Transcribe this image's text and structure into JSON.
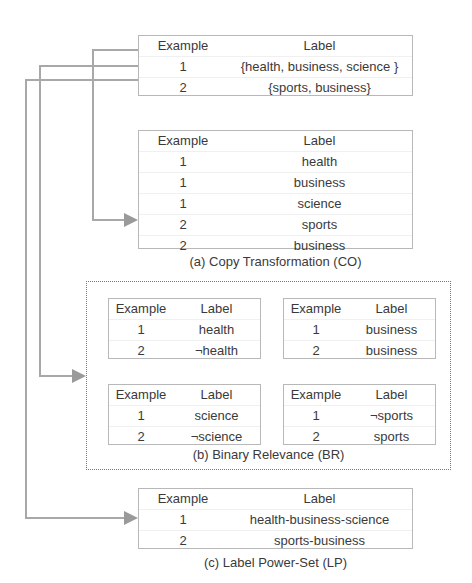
{
  "colors": {
    "connector": "#a8a8a8",
    "arrowhead": "#9a9a9a",
    "table_border": "#b8b8b8",
    "text": "#3a3a3a"
  },
  "original": {
    "headers": [
      "Example",
      "Label"
    ],
    "rows": [
      [
        "1",
        "{health, business, science }"
      ],
      [
        "2",
        "{sports, business}"
      ]
    ]
  },
  "copy_transformation": {
    "caption": "(a) Copy Transformation (CO)",
    "headers": [
      "Example",
      "Label"
    ],
    "rows": [
      [
        "1",
        "health"
      ],
      [
        "1",
        "business"
      ],
      [
        "1",
        "science"
      ],
      [
        "2",
        "sports"
      ],
      [
        "2",
        "business"
      ]
    ]
  },
  "binary_relevance": {
    "caption": "(b) Binary Relevance (BR)",
    "tables": [
      {
        "headers": [
          "Example",
          "Label"
        ],
        "rows": [
          [
            "1",
            "health"
          ],
          [
            "2",
            "¬health"
          ]
        ]
      },
      {
        "headers": [
          "Example",
          "Label"
        ],
        "rows": [
          [
            "1",
            "business"
          ],
          [
            "2",
            "business"
          ]
        ]
      },
      {
        "headers": [
          "Example",
          "Label"
        ],
        "rows": [
          [
            "1",
            "science"
          ],
          [
            "2",
            "¬science"
          ]
        ]
      },
      {
        "headers": [
          "Example",
          "Label"
        ],
        "rows": [
          [
            "1",
            "¬sports"
          ],
          [
            "2",
            "sports"
          ]
        ]
      }
    ]
  },
  "label_power_set": {
    "caption": "(c) Label Power-Set (LP)",
    "headers": [
      "Example",
      "Label"
    ],
    "rows": [
      [
        "1",
        "health-business-science"
      ],
      [
        "2",
        "sports-business"
      ]
    ]
  }
}
